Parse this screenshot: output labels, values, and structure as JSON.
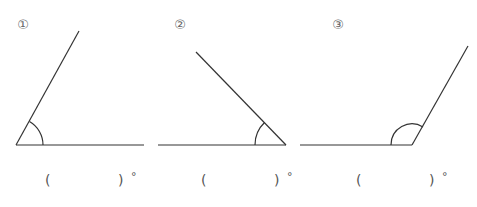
{
  "problems": [
    {
      "label": "①",
      "answer_open": "(",
      "answer_close": ")",
      "unit": "°",
      "angle_type": "acute"
    },
    {
      "label": "②",
      "answer_open": "(",
      "answer_close": ")",
      "unit": "°",
      "angle_type": "acute"
    },
    {
      "label": "③",
      "answer_open": "(",
      "answer_close": ")",
      "unit": "°",
      "angle_type": "obtuse"
    }
  ],
  "colors": {
    "line": "#333333",
    "text": "#666666"
  }
}
